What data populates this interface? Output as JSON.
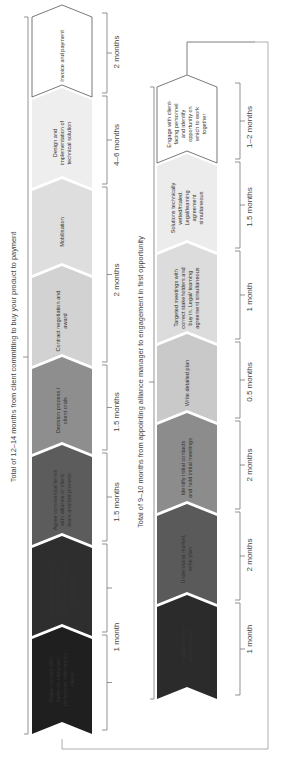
{
  "diagram": {
    "row1": {
      "steps": [
        {
          "label": "Engagement of alliance lead",
          "duration": "1 month",
          "fill": "#2b2b2b",
          "text_color": "#ffffff"
        },
        {
          "label": "Understand market, write plan",
          "duration": "2 months",
          "fill": "#5a5a5a",
          "text_color": "#ffffff"
        },
        {
          "label": "Identify initial contacts and hold initial meetings",
          "duration": "2 months",
          "fill": "#8c8c8c",
          "text_color": "#ffffff"
        },
        {
          "label": "Write detailed plan",
          "duration": "0.5 months",
          "fill": "#c9c9c9",
          "text_color": "#333333"
        },
        {
          "label": "Targeted meetings with correct stakeholders and buy in. Legal/ teaming agreement simultaneous",
          "duration": "1 month",
          "fill": "#dcdcdc",
          "text_color": "#333333"
        },
        {
          "label": "Solutions technically vetted/trialed. Legal/teaming agreement simultaneous",
          "duration": "1.5 months",
          "fill": "#ececec",
          "text_color": "#333333"
        },
        {
          "label": "Engage with client-facing personnel and identify opportunity on which to work together",
          "duration": "1–2 months",
          "fill": "#ffffff",
          "text_color": "#333333"
        }
      ],
      "total": "Total of 9–10 months from appointing alliance manager to engagement in first opportunity"
    },
    "row2": {
      "steps": [
        {
          "label": "Make contact with systems integrator personnel referred by client",
          "duration": "1 month",
          "fill": "#1f1f1f",
          "text_color": "#ffffff"
        },
        {
          "label": "Agree involvement of your product in the technical solution with new partner",
          "duration": "1 month",
          "fill": "#2e2e2e",
          "text_color": "#ffffff"
        },
        {
          "label": "Agree commercial terms with alliance or client team and bid process",
          "duration": "1.5 months",
          "fill": "#5c5c5c",
          "text_color": "#ffffff"
        },
        {
          "label": "Decision process / client orals",
          "duration": "1.5 months",
          "fill": "#8e8e8e",
          "text_color": "#ffffff"
        },
        {
          "label": "Contract negotiation and award",
          "duration": "2 months",
          "fill": "#d2d2d2",
          "text_color": "#333333"
        },
        {
          "label": "Mobilisation",
          "duration": "2 months",
          "fill": "#dedede",
          "text_color": "#333333"
        },
        {
          "label": "Design and implementation of technical solution",
          "duration": "4–6 months",
          "fill": "#eeeeee",
          "text_color": "#333333"
        },
        {
          "label": "Invoice and payment",
          "duration": "2 months",
          "fill": "#ffffff",
          "text_color": "#333333"
        }
      ],
      "total": "Total of 12–14 months from client committing to buy your product to payment"
    },
    "colors": {
      "line": "#9a9a9a",
      "outline": "#555555"
    }
  }
}
